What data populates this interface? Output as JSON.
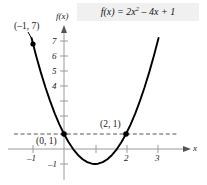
{
  "figure": {
    "title_plain": "f(x) = 2x^2 - 4x + 1",
    "function_prefix": "f(x) = 2x",
    "function_exponent": "2",
    "function_suffix": " – 4x + 1",
    "axis_labels": {
      "y": "f(x)",
      "x": "x"
    },
    "point_labels": {
      "p1": "(–1, 7)",
      "p2": "(0, 1)",
      "p3": "(2, 1)"
    },
    "y_tick_labels": [
      "7",
      "6",
      "5",
      "4",
      "–1"
    ],
    "x_tick_labels": [
      "–1",
      "2",
      "3"
    ],
    "colors": {
      "curve": "#000000",
      "axis": "#9a9a9a",
      "dashed": "#555555",
      "point": "#000000",
      "title_bg": "#f0f0f0",
      "background": "#ffffff"
    }
  },
  "chart_data": {
    "type": "line",
    "xlabel": "x",
    "ylabel": "f(x)",
    "xlim": [
      -1.55,
      3.6
    ],
    "ylim": [
      -1.9,
      8.2
    ],
    "grid": false,
    "legend": null,
    "equation": "f(x) = 2x^2 - 4x + 1",
    "coefficients": {
      "a": 2,
      "b": -4,
      "c": 1
    },
    "vertex": [
      1,
      -1
    ],
    "series": [
      {
        "name": "f(x) = 2x² – 4x + 1",
        "x": [
          -1.05,
          -0.9,
          -0.75,
          -0.6,
          -0.45,
          -0.3,
          -0.15,
          0,
          0.15,
          0.3,
          0.45,
          0.6,
          0.75,
          0.9,
          1,
          1.1,
          1.25,
          1.4,
          1.55,
          1.7,
          1.85,
          2,
          2.15,
          2.3,
          2.45,
          2.6,
          2.75,
          2.9,
          3.05
        ],
        "y": [
          7.41,
          6.22,
          5.125,
          4.12,
          3.205,
          2.38,
          1.645,
          1,
          0.445,
          -0.02,
          -0.395,
          -0.68,
          -0.875,
          -0.98,
          -1,
          -0.98,
          -0.875,
          -0.68,
          -0.395,
          -0.02,
          0.445,
          1,
          1.645,
          2.38,
          3.205,
          4.12,
          5.125,
          6.22,
          7.405
        ]
      }
    ],
    "marked_points": [
      {
        "label": "(–1, 7)",
        "x": -1,
        "y": 7
      },
      {
        "label": "(0, 1)",
        "x": 0,
        "y": 1
      },
      {
        "label": "(2, 1)",
        "x": 2,
        "y": 1
      }
    ],
    "reference_lines": [
      {
        "orientation": "horizontal",
        "value": 1,
        "style": "dashed"
      }
    ],
    "y_ticks_labeled": [
      7,
      6,
      5,
      4,
      -1
    ],
    "y_ticks_all": [
      -1,
      1,
      2,
      3,
      4,
      5,
      6,
      7
    ],
    "x_ticks_labeled": [
      -1,
      2,
      3
    ],
    "x_ticks_all": [
      -1,
      1,
      2,
      3
    ]
  }
}
